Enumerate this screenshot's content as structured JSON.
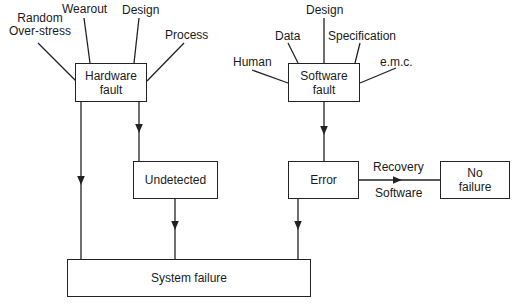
{
  "diagram": {
    "type": "fault-tree flow diagram",
    "nodes": {
      "hardware_fault": {
        "line1": "Hardware",
        "line2": "fault"
      },
      "software_fault": {
        "line1": "Software",
        "line2": "fault"
      },
      "undetected": {
        "label": "Undetected"
      },
      "error": {
        "label": "Error"
      },
      "no_failure": {
        "line1": "No",
        "line2": "failure"
      },
      "system_failure": {
        "label": "System failure"
      }
    },
    "hardware_causes": {
      "random_line1": "Random",
      "random_line2": "Over-stress",
      "wearout": "Wearout",
      "design": "Design",
      "process": "Process"
    },
    "software_causes": {
      "human": "Human",
      "data": "Data",
      "design": "Design",
      "specification": "Specification",
      "emc": "e.m.c."
    },
    "edge_labels": {
      "recovery": "Recovery",
      "software": "Software"
    },
    "edges": [
      {
        "from": "hardware_fault",
        "to": "system_failure"
      },
      {
        "from": "hardware_fault",
        "to": "undetected"
      },
      {
        "from": "undetected",
        "to": "system_failure"
      },
      {
        "from": "software_fault",
        "to": "error"
      },
      {
        "from": "error",
        "to": "system_failure"
      },
      {
        "from": "error",
        "to": "no_failure",
        "label": "Recovery Software"
      }
    ]
  }
}
